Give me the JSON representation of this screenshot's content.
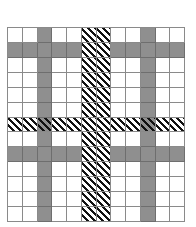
{
  "grid": {
    "columns": 12,
    "rows": 13,
    "gray_columns": [
      2,
      9
    ],
    "gray_rows": [
      1,
      8
    ],
    "hatched_columns": [
      5,
      6
    ],
    "hatched_rows": [
      6
    ],
    "colors": {
      "background": "#ffffff",
      "gray_fill": "#8f8f8f",
      "grid_line": "#8a8a8a",
      "hatch_stripe": "#111111"
    },
    "hatch_direction": "diagonal top-left to bottom-right"
  }
}
